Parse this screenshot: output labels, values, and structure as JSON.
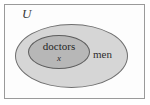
{
  "diagram": {
    "type": "euler-venn",
    "universe": {
      "label": "U",
      "name": "universal-set"
    },
    "sets": [
      {
        "id": "men",
        "label": "men",
        "role": "outer-set",
        "fill": "#d6d6d6",
        "stroke": "#6f6f6f"
      },
      {
        "id": "doctors",
        "label": "doctors",
        "role": "inner-subset",
        "fill": "#b7b7b7",
        "stroke": "#5e5e5e"
      }
    ],
    "elements": [
      {
        "id": "x",
        "label": "x",
        "member_of": "doctors"
      }
    ],
    "frame": {
      "border_color": "#9a9a9a",
      "background": "#fdfdfd"
    }
  }
}
